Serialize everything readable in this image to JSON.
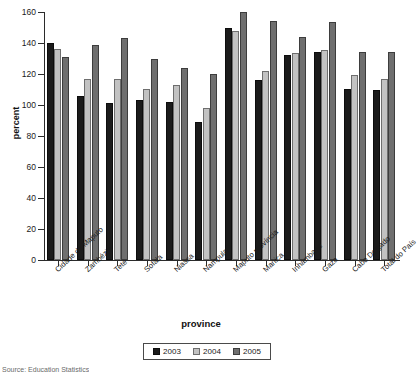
{
  "chart_data": {
    "type": "bar",
    "title": "",
    "xlabel": "province",
    "ylabel": "percent",
    "ylim": [
      0,
      160
    ],
    "yticks": [
      0,
      20,
      40,
      60,
      80,
      100,
      120,
      140,
      160
    ],
    "grid": false,
    "legend_position": "bottom",
    "categories": [
      "Cidade de Maputo",
      "Zambézia",
      "Tete",
      "Sofala",
      "Niassa",
      "Nampula",
      "Maputo província",
      "Manica",
      "Inhambane",
      "Gaza",
      "Cabo Delgado",
      "Total do País"
    ],
    "series": [
      {
        "name": "2003",
        "color": "#1b1b1b",
        "values": [
          140,
          106,
          101.5,
          103,
          102,
          89,
          150,
          116,
          132,
          134,
          110.5,
          110
        ]
      },
      {
        "name": "2004",
        "color": "#c2c2c2",
        "values": [
          136,
          116.5,
          117,
          110.5,
          113,
          98,
          148,
          122,
          133.5,
          135.5,
          119.5,
          117
        ]
      },
      {
        "name": "2005",
        "color": "#6f6f6f",
        "values": [
          131,
          139,
          143,
          129.5,
          124,
          120,
          160,
          154,
          144,
          153.5,
          134,
          134.5
        ]
      }
    ]
  },
  "legend": {
    "entries": [
      "2003",
      "2004",
      "2005"
    ]
  },
  "axes": {
    "y_title": "percent",
    "x_title": "province",
    "y_tick_labels": [
      "0",
      "20",
      "40",
      "60",
      "80",
      "100",
      "120",
      "140",
      "160"
    ]
  },
  "footer": {
    "source": "Source: Education Statistics"
  }
}
